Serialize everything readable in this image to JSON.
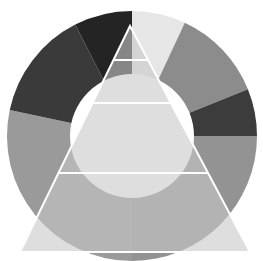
{
  "diagram": {
    "type": "donut-with-pyramid-overlay",
    "ring": {
      "center": [
        132,
        136
      ],
      "outer_radius": 125,
      "inner_radius": 62,
      "hole_color": "#ffffff",
      "segments": [
        {
          "name": "segment-top-light",
          "start_deg": 0,
          "end_deg": 25,
          "color": "#e6e6e6"
        },
        {
          "name": "segment-upper-right",
          "start_deg": 25,
          "end_deg": 68,
          "color": "#8c8c8c"
        },
        {
          "name": "segment-right-dark",
          "start_deg": 68,
          "end_deg": 90,
          "color": "#3c3c3c"
        },
        {
          "name": "segment-right-gray",
          "start_deg": 90,
          "end_deg": 180,
          "color": "#939393"
        },
        {
          "name": "segment-left-gray",
          "start_deg": 180,
          "end_deg": 282,
          "color": "#9a9a9a"
        },
        {
          "name": "segment-upper-left-dark",
          "start_deg": 282,
          "end_deg": 333,
          "color": "#3a3a3a"
        },
        {
          "name": "segment-top-darkest",
          "start_deg": 333,
          "end_deg": 360,
          "color": "#242424"
        }
      ]
    },
    "pyramid": {
      "apex": [
        130,
        26
      ],
      "base_left": [
        20,
        252
      ],
      "base_right": [
        250,
        252
      ],
      "fill": "#c8c8c8",
      "fill_opacity": 0.6,
      "divider_color": "#ffffff",
      "tier_lines_y": [
        60,
        103,
        173
      ],
      "tiers": [
        {
          "name": "tier-1-top"
        },
        {
          "name": "tier-2"
        },
        {
          "name": "tier-3"
        },
        {
          "name": "tier-4-base"
        }
      ]
    }
  }
}
